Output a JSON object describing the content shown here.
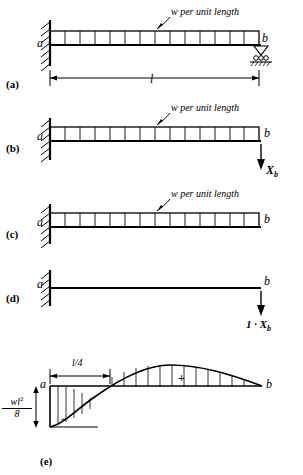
{
  "figure": {
    "panels": [
      {
        "id": "a",
        "label": "(a)",
        "load_note": "w per unit length",
        "left_support_label": "a",
        "right_support_label": "b",
        "span_label": "l",
        "left_support_type": "fixed-hatched-wall",
        "right_support_type": "roller"
      },
      {
        "id": "b",
        "label": "(b)",
        "load_note": "w per unit length",
        "left_support_label": "a",
        "right_support_label": "b",
        "force_label": "X",
        "force_sub": "b",
        "force_direction": "down"
      },
      {
        "id": "c",
        "label": "(c)",
        "load_note": "w per unit length",
        "left_support_label": "a",
        "right_support_label": "b"
      },
      {
        "id": "d",
        "label": "(d)",
        "left_support_label": "a",
        "right_support_label": "b",
        "force_label": "1 · X",
        "force_sub": "b",
        "force_direction": "down"
      },
      {
        "id": "e",
        "label": "(e)",
        "left_label": "a",
        "right_label": "b",
        "dim_label": "l/4",
        "ordinate_num": "wl",
        "ordinate_num_exp": "2",
        "ordinate_den": "8",
        "sign_negative": "−",
        "sign_positive": "+"
      }
    ]
  }
}
